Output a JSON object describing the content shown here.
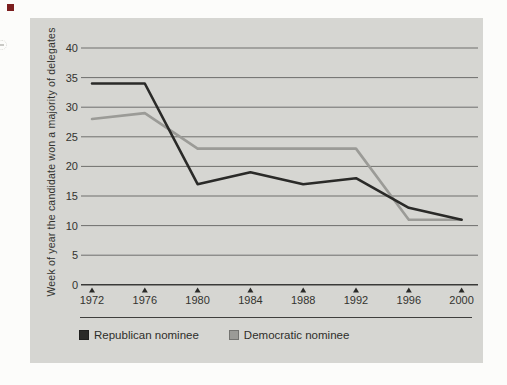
{
  "decorations": {
    "bullet_color": "#7b1e1e"
  },
  "colors": {
    "page_bg": "#fcfcfa",
    "panel_bg": "#d6d6d2",
    "gridline": "#6f6f6d",
    "axis_line": "#3a3a38",
    "tick_marker": "#2a2a28",
    "text": "#33332f",
    "separator": "#3f3f3d",
    "republican": "#2a2a28",
    "democratic": "#9b9b97"
  },
  "chart_data": {
    "type": "line",
    "title": "",
    "ylabel": "Week of year the candidate won a majority of delegates",
    "xlabel": "",
    "ylim": [
      0,
      40
    ],
    "y_ticks": [
      0,
      5,
      10,
      15,
      20,
      25,
      30,
      35,
      40
    ],
    "categories": [
      "1972",
      "1976",
      "1980",
      "1984",
      "1988",
      "1992",
      "1996",
      "2000"
    ],
    "x": [
      1972,
      1976,
      1980,
      1984,
      1988,
      1992,
      1996,
      2000
    ],
    "grid": "horizontal",
    "legend_position": "bottom",
    "series": [
      {
        "name": "Republican nominee",
        "color": "#2a2a28",
        "values": [
          34,
          34,
          17,
          19,
          17,
          18,
          13,
          11
        ]
      },
      {
        "name": "Democratic nominee",
        "color": "#9b9b97",
        "values": [
          28,
          29,
          23,
          23,
          23,
          23,
          11,
          11
        ]
      }
    ]
  },
  "legend": {
    "items": [
      {
        "label": "Republican nominee",
        "color": "#2a2a28"
      },
      {
        "label": "Democratic nominee",
        "color": "#9b9b97"
      }
    ]
  }
}
